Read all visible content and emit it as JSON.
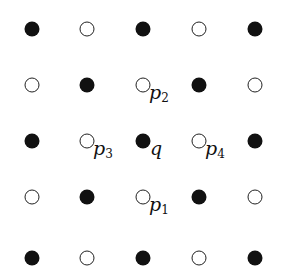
{
  "diagram": {
    "type": "5x5 checkerboard lattice of points",
    "grid": {
      "cols_x": [
        32,
        87,
        143,
        199,
        255
      ],
      "rows_y": [
        29,
        85,
        141,
        197,
        258
      ]
    },
    "rows": [
      [
        "filled",
        "open",
        "filled",
        "open",
        "filled"
      ],
      [
        "open",
        "filled",
        "open",
        "filled",
        "open"
      ],
      [
        "filled",
        "open",
        "filled",
        "open",
        "filled"
      ],
      [
        "open",
        "filled",
        "open",
        "filled",
        "open"
      ],
      [
        "filled",
        "open",
        "filled",
        "open",
        "filled"
      ]
    ],
    "labels": [
      {
        "text": "p",
        "sub": "2",
        "row": 1,
        "col": 2,
        "dx": 6,
        "dy": -2
      },
      {
        "text": "p",
        "sub": "3",
        "row": 2,
        "col": 1,
        "dx": 6,
        "dy": -2
      },
      {
        "text": "q",
        "sub": "",
        "row": 2,
        "col": 2,
        "dx": 7,
        "dy": -2
      },
      {
        "text": "p",
        "sub": "4",
        "row": 2,
        "col": 3,
        "dx": 6,
        "dy": -2
      },
      {
        "text": "p",
        "sub": "1",
        "row": 3,
        "col": 2,
        "dx": 6,
        "dy": -2
      }
    ]
  }
}
